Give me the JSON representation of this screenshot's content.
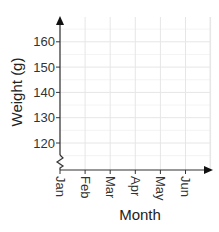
{
  "chart_data": {
    "type": "line",
    "title": "",
    "xlabel": "Month",
    "ylabel": "Weight (g)",
    "categories": [
      "Jan",
      "Feb",
      "Mar",
      "Apr",
      "May",
      "Jun"
    ],
    "yticks": [
      120,
      130,
      140,
      150,
      160
    ],
    "ylim": [
      113,
      170
    ],
    "series": [],
    "grid": true,
    "y_axis_break": true,
    "legend": null
  },
  "colors": {
    "axis": "#333333",
    "grid": "#e6e6e6"
  }
}
